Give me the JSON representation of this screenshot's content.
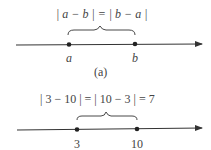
{
  "figure_a": {
    "equation": "| a − b | = | b − a |",
    "point_left": "a",
    "point_right": "b",
    "caption": "(a)"
  },
  "figure_b": {
    "equation": "| 3 − 10 | = | 10 − 3 | = 7",
    "point_left": "3",
    "point_right": "10"
  }
}
